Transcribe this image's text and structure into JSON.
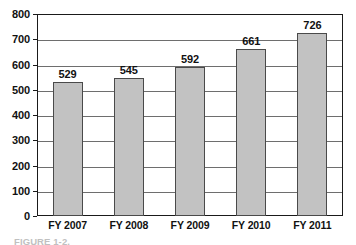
{
  "chart_data": {
    "type": "bar",
    "title": "",
    "xlabel": "",
    "ylabel": "",
    "categories": [
      "FY 2007",
      "FY 2008",
      "FY 2009",
      "FY 2010",
      "FY 2011"
    ],
    "values": [
      529,
      545,
      592,
      661,
      726
    ],
    "ylim": [
      0,
      800
    ],
    "ytick_labels": [
      "800",
      "700",
      "600",
      "500",
      "400",
      "300",
      "200",
      "100",
      "0"
    ],
    "ytick_values": [
      800,
      700,
      600,
      500,
      400,
      300,
      200,
      100,
      0
    ],
    "grid": true,
    "grid_axis": "y",
    "legend": false,
    "legend_position": "none",
    "bar_fill_color": "#c2c2c2",
    "bar_border_color": "#4a4a4a",
    "gridline_color": "#6e6e6e",
    "axis_color": "#1a1a1a",
    "text_color": "#111111",
    "data_labels": [
      "529",
      "545",
      "592",
      "661",
      "726"
    ]
  },
  "caption": {
    "text": "FIGURE 1-2."
  }
}
